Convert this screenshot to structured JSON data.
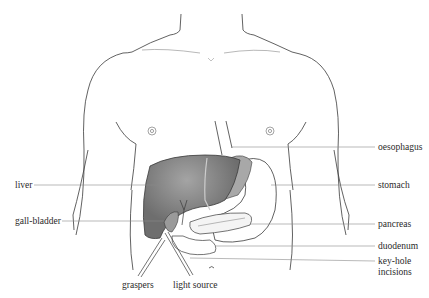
{
  "diagram": {
    "colors": {
      "outline": "#3a3a3a",
      "liver": "#6e6e6e",
      "liver_highlight": "#9a9a9a",
      "stomach_shade": "#a8a8a8",
      "leader_line": "#8a8a8a",
      "text": "#2a2a2a",
      "background": "#ffffff"
    },
    "labels": {
      "left": [
        {
          "id": "liver",
          "text": "liver"
        },
        {
          "id": "gall_bladder",
          "text": "gall-bladder"
        }
      ],
      "right": [
        {
          "id": "oesophagus",
          "text": "oesophagus"
        },
        {
          "id": "stomach",
          "text": "stomach"
        },
        {
          "id": "pancreas",
          "text": "pancreas"
        },
        {
          "id": "duodenum",
          "text": "duodenum"
        },
        {
          "id": "keyhole_line1",
          "text": "key-hole"
        },
        {
          "id": "keyhole_line2",
          "text": "incisions"
        }
      ],
      "bottom": [
        {
          "id": "graspers",
          "text": "graspers"
        },
        {
          "id": "light_source",
          "text": "light source"
        }
      ]
    }
  }
}
